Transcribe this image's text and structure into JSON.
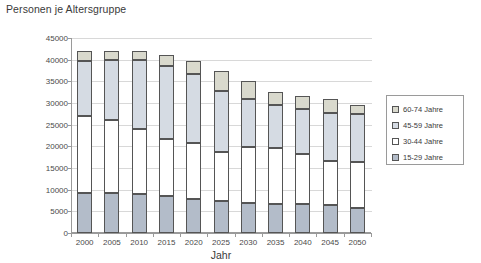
{
  "chart_data": {
    "type": "bar",
    "subtype": "stacked-column",
    "title": "Personen je Altersgruppe",
    "xlabel": "Jahr",
    "ylabel": "",
    "ylim": [
      0,
      45000
    ],
    "ytick_step": 5000,
    "yticks": [
      0,
      5000,
      10000,
      15000,
      20000,
      25000,
      30000,
      35000,
      40000,
      45000
    ],
    "ytick_labels": [
      "0",
      "5000",
      "10000",
      "15000",
      "20000",
      "25000",
      "30000",
      "35000",
      "40000",
      "45000"
    ],
    "grid": true,
    "legend_position": "right",
    "categories": [
      "2000",
      "2005",
      "2010",
      "2015",
      "2020",
      "2025",
      "2030",
      "2035",
      "2040",
      "2045",
      "2050"
    ],
    "series": [
      {
        "name": "15-29 Jahre",
        "color": "#b3bcc9",
        "values": [
          9200,
          9200,
          9000,
          8600,
          7800,
          7300,
          7000,
          6700,
          6700,
          6400,
          5700
        ]
      },
      {
        "name": "30-44 Jahre",
        "color": "#ffffff",
        "values": [
          17900,
          16900,
          15000,
          13100,
          12900,
          11500,
          12900,
          13000,
          11500,
          10200,
          10800
        ]
      },
      {
        "name": "45-59 Jahre",
        "color": "#d5dbe3",
        "values": [
          12700,
          13800,
          15900,
          16900,
          15900,
          14000,
          11100,
          9800,
          10400,
          11200,
          10900
        ]
      },
      {
        "name": "60-74 Jahre",
        "color": "#d9d9cd",
        "values": [
          2200,
          2100,
          2100,
          2500,
          3000,
          4700,
          4000,
          3000,
          3100,
          3200,
          2200
        ]
      }
    ],
    "totals": [
      42000,
      42000,
      42000,
      41100,
      39600,
      37500,
      35000,
      32500,
      31700,
      31000,
      29600
    ],
    "colors": {
      "axis": "#9a9a9a",
      "grid": "#d8d8d8",
      "bar_border": "#555555",
      "text": "#3a3a3a",
      "background": "#ffffff"
    }
  },
  "legend": {
    "items": [
      {
        "label": "60-74 Jahre"
      },
      {
        "label": "45-59 Jahre"
      },
      {
        "label": "30-44 Jahre"
      },
      {
        "label": "15-29 Jahre"
      }
    ]
  }
}
